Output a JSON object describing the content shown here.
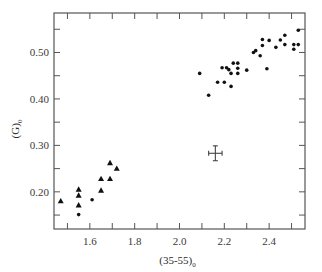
{
  "chart_data": {
    "type": "scatter",
    "title": "",
    "xlabel": "(35-55)",
    "xlabel_subscript": "0",
    "ylabel": "(G)",
    "ylabel_subscript": "0",
    "xlim": [
      1.44,
      2.56
    ],
    "ylim": [
      0.12,
      0.585
    ],
    "xticks_major": [
      1.6,
      1.8,
      2.0,
      2.2,
      2.4
    ],
    "xticks_major_labels": [
      "1.6",
      "1.8",
      "2.0",
      "2.2",
      "2.4"
    ],
    "xticks_minor": [
      1.5,
      1.7,
      1.9,
      2.1,
      2.3,
      2.5
    ],
    "yticks_major": [
      0.2,
      0.3,
      0.4,
      0.5
    ],
    "yticks_major_labels": [
      "0.20",
      "0.30",
      "0.40",
      "0.50"
    ],
    "yticks_minor": [
      0.15,
      0.25,
      0.35,
      0.45,
      0.55
    ],
    "grid": false,
    "legend": null,
    "series": [
      {
        "name": "triangles",
        "marker": "triangle",
        "points": [
          {
            "x": 1.47,
            "y": 0.18
          },
          {
            "x": 1.55,
            "y": 0.205
          },
          {
            "x": 1.55,
            "y": 0.192
          },
          {
            "x": 1.55,
            "y": 0.171
          },
          {
            "x": 1.65,
            "y": 0.228
          },
          {
            "x": 1.65,
            "y": 0.203
          },
          {
            "x": 1.69,
            "y": 0.228
          },
          {
            "x": 1.69,
            "y": 0.262
          },
          {
            "x": 1.72,
            "y": 0.25
          }
        ]
      },
      {
        "name": "dots",
        "marker": "circle",
        "points": [
          {
            "x": 1.55,
            "y": 0.151
          },
          {
            "x": 1.61,
            "y": 0.183
          },
          {
            "x": 2.09,
            "y": 0.455
          },
          {
            "x": 2.13,
            "y": 0.408
          },
          {
            "x": 2.17,
            "y": 0.436
          },
          {
            "x": 2.2,
            "y": 0.436
          },
          {
            "x": 2.19,
            "y": 0.467
          },
          {
            "x": 2.21,
            "y": 0.467
          },
          {
            "x": 2.22,
            "y": 0.463
          },
          {
            "x": 2.24,
            "y": 0.477
          },
          {
            "x": 2.26,
            "y": 0.477
          },
          {
            "x": 2.26,
            "y": 0.466
          },
          {
            "x": 2.26,
            "y": 0.455
          },
          {
            "x": 2.23,
            "y": 0.455
          },
          {
            "x": 2.23,
            "y": 0.427
          },
          {
            "x": 2.3,
            "y": 0.462
          },
          {
            "x": 2.33,
            "y": 0.5
          },
          {
            "x": 2.34,
            "y": 0.504
          },
          {
            "x": 2.36,
            "y": 0.493
          },
          {
            "x": 2.37,
            "y": 0.528
          },
          {
            "x": 2.37,
            "y": 0.515
          },
          {
            "x": 2.4,
            "y": 0.526
          },
          {
            "x": 2.39,
            "y": 0.465
          },
          {
            "x": 2.43,
            "y": 0.511
          },
          {
            "x": 2.45,
            "y": 0.527
          },
          {
            "x": 2.47,
            "y": 0.537
          },
          {
            "x": 2.47,
            "y": 0.517
          },
          {
            "x": 2.51,
            "y": 0.517
          },
          {
            "x": 2.51,
            "y": 0.507
          },
          {
            "x": 2.53,
            "y": 0.517
          },
          {
            "x": 2.53,
            "y": 0.548
          }
        ]
      }
    ],
    "annotations": [
      {
        "type": "error-bar",
        "x": 2.16,
        "y": 0.283,
        "xerr": 0.03,
        "yerr": 0.016
      }
    ]
  },
  "layout": {
    "plot_left_px": 54,
    "plot_right_px": 305,
    "plot_top_px": 13,
    "plot_bottom_px": 229,
    "axis_color": "#555555",
    "marker_color": "#111111"
  }
}
